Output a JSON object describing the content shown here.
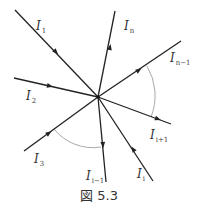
{
  "figure": {
    "caption": "図 5.3",
    "center": [
      98,
      97
    ],
    "line_color": "#222222",
    "arc_color": "#aaaaaa"
  },
  "currents": [
    {
      "id": "I1",
      "base": "I",
      "sub": "1",
      "end": [
        15,
        10
      ],
      "direction": "in",
      "arrow": [
        56,
        52
      ],
      "label_pos": [
        36,
        30
      ]
    },
    {
      "id": "I2",
      "base": "I",
      "sub": "2",
      "end": [
        14,
        78
      ],
      "direction": "in",
      "arrow": [
        50,
        86
      ],
      "label_pos": [
        26,
        100
      ]
    },
    {
      "id": "I3",
      "base": "I",
      "sub": "3",
      "end": [
        24,
        151
      ],
      "direction": "in",
      "arrow": [
        49,
        133
      ],
      "label_pos": [
        34,
        163
      ]
    },
    {
      "id": "Ii-1",
      "base": "I",
      "sub": "i−1",
      "end": [
        106,
        182
      ],
      "direction": "out",
      "arrow": [
        103,
        145
      ],
      "label_pos": [
        86,
        180
      ]
    },
    {
      "id": "Ii",
      "base": "I",
      "sub": "i",
      "end": [
        153,
        181
      ],
      "direction": "in",
      "arrow": [
        133,
        149
      ],
      "label_pos": [
        137,
        178
      ]
    },
    {
      "id": "Ii+1",
      "base": "I",
      "sub": "i+1",
      "end": [
        171,
        124
      ],
      "direction": "out",
      "arrow": [
        158,
        119
      ],
      "label_pos": [
        150,
        139
      ]
    },
    {
      "id": "In-1",
      "base": "I",
      "sub": "n−1",
      "end": [
        181,
        41
      ],
      "direction": "out",
      "arrow": [
        139,
        70
      ],
      "label_pos": [
        170,
        62
      ]
    },
    {
      "id": "In",
      "base": "I",
      "sub": "n",
      "end": [
        115,
        11
      ],
      "direction": "out",
      "arrow": [
        110,
        47
      ],
      "label_pos": [
        124,
        30
      ]
    }
  ],
  "arcs": [
    {
      "between": [
        "In-1",
        "Ii+1"
      ],
      "path": "M 147 66 A 58 58 0 0 1 151 117"
    },
    {
      "between": [
        "I3",
        "Ii-1"
      ],
      "path": "M 54 129 A 50 50 0 0 0 101 147"
    }
  ]
}
